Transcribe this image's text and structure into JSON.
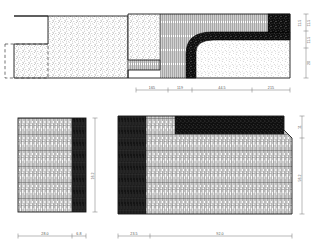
{
  "sheet": {
    "title": "Artefact profile drawing",
    "background": "#ffffff",
    "line_color": "#1a1a1a",
    "dim_color": "#666666",
    "dark_fill": "#111111"
  },
  "views": {
    "top_left": {
      "name": "plan-view-top-left",
      "fill_pattern": "stipple",
      "has_notch": true,
      "has_dashed_outline": true
    },
    "top_right": {
      "name": "section-view-top-right",
      "fill_patterns": [
        "stipple",
        "vertical-hatch",
        "dark-grain"
      ],
      "has_curved_band": true
    },
    "bottom_left": {
      "name": "elevation-view-bottom-left",
      "fill_patterns": [
        "vertical-hatch",
        "dark-edge"
      ]
    },
    "bottom_right": {
      "name": "elevation-view-bottom-right",
      "fill_patterns": [
        "vertical-hatch",
        "dark-band",
        "dark-edge"
      ]
    }
  },
  "dimensions": {
    "top_horizontal": [
      {
        "label": "165",
        "x": 152,
        "y": 94
      },
      {
        "label": "119",
        "x": 180,
        "y": 94
      },
      {
        "label": "44.5",
        "x": 222,
        "y": 94
      },
      {
        "label": "215",
        "x": 268,
        "y": 94
      }
    ],
    "top_vertical": [
      {
        "label": "11.5",
        "x": 309,
        "y": 20
      },
      {
        "label": "11.5",
        "x": 303,
        "y": 20
      },
      {
        "label": "11.5",
        "x": 309,
        "y": 42
      },
      {
        "label": "20",
        "x": 309,
        "y": 68
      }
    ],
    "bottom_left_horizontal": [
      {
        "label": "28.0",
        "x": 44,
        "y": 239
      },
      {
        "label": "6.8",
        "x": 80,
        "y": 239
      }
    ],
    "bottom_left_vertical": [
      {
        "label": "16.2",
        "x": 97,
        "y": 176
      }
    ],
    "bottom_right_horizontal": [
      {
        "label": "23.5",
        "x": 134,
        "y": 239
      },
      {
        "label": "92.0",
        "x": 215,
        "y": 239
      }
    ],
    "bottom_right_vertical": [
      {
        "label": "11",
        "x": 305,
        "y": 128
      },
      {
        "label": "56.2",
        "x": 305,
        "y": 186
      }
    ]
  }
}
